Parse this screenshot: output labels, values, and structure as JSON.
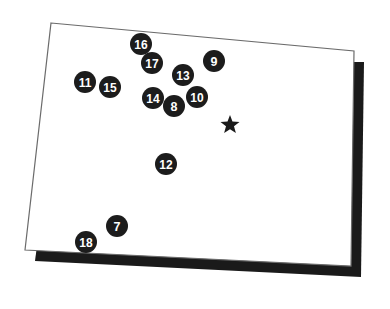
{
  "figure": {
    "type": "point-location-map",
    "colors": {
      "background": "#ffffff",
      "map_fill": "#ffffff",
      "map_outline": "#6b6b6b",
      "shadow": "#1a1a1a",
      "marker_fill": "#1c1c1c",
      "marker_text": "#ffffff",
      "star_fill": "#1a1a1a"
    },
    "map_outline": {
      "shape": "quadrilateral",
      "corners": [
        {
          "name": "top-left",
          "x": 51,
          "y": 23
        },
        {
          "name": "top-right",
          "x": 354,
          "y": 51
        },
        {
          "name": "bottom-right",
          "x": 351,
          "y": 266
        },
        {
          "name": "bottom-left",
          "x": 25,
          "y": 250
        }
      ],
      "stroke_width": 1.2
    },
    "drop_shadow": {
      "offset_x": 10,
      "offset_y": 11,
      "corners": [
        {
          "name": "top-left",
          "x": 61,
          "y": 62
        },
        {
          "name": "top-right",
          "x": 364,
          "y": 62
        },
        {
          "name": "bottom-right",
          "x": 361,
          "y": 277
        },
        {
          "name": "bottom-left",
          "x": 35,
          "y": 261
        }
      ]
    },
    "star": {
      "label": "star-landmark",
      "x": 230,
      "y": 125,
      "radius": 10,
      "points": 5
    },
    "markers": [
      {
        "id": "marker-16",
        "label": "16",
        "x": 141,
        "y": 44,
        "r": 11
      },
      {
        "id": "marker-9",
        "label": "9",
        "x": 214,
        "y": 61,
        "r": 11
      },
      {
        "id": "marker-17",
        "label": "17",
        "x": 152,
        "y": 63,
        "r": 11
      },
      {
        "id": "marker-13",
        "label": "13",
        "x": 183,
        "y": 75,
        "r": 11
      },
      {
        "id": "marker-11",
        "label": "11",
        "x": 85,
        "y": 82,
        "r": 11
      },
      {
        "id": "marker-15",
        "label": "15",
        "x": 110,
        "y": 87,
        "r": 11
      },
      {
        "id": "marker-14",
        "label": "14",
        "x": 153,
        "y": 98,
        "r": 11
      },
      {
        "id": "marker-10",
        "label": "10",
        "x": 197,
        "y": 97,
        "r": 11
      },
      {
        "id": "marker-8",
        "label": "8",
        "x": 174,
        "y": 106,
        "r": 11
      },
      {
        "id": "marker-12",
        "label": "12",
        "x": 166,
        "y": 164,
        "r": 11
      },
      {
        "id": "marker-7",
        "label": "7",
        "x": 117,
        "y": 226,
        "r": 11
      },
      {
        "id": "marker-18",
        "label": "18",
        "x": 86,
        "y": 242,
        "r": 11
      }
    ]
  }
}
